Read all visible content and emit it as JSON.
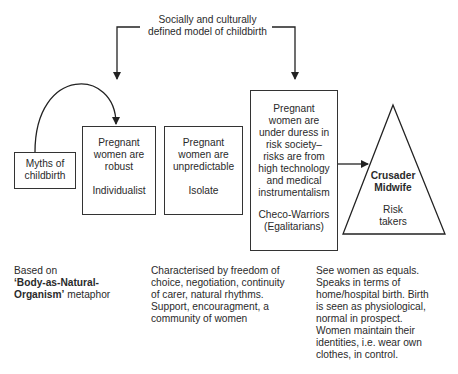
{
  "diagram": {
    "title_lines": [
      "Socially and culturally",
      "defined model of childbirth"
    ],
    "myths_box": {
      "lines": [
        "Myths of",
        "childbirth"
      ]
    },
    "box_robust": {
      "lines": [
        "Pregnant",
        "women are",
        "robust"
      ],
      "label": "Individualist"
    },
    "box_unpredictable": {
      "lines": [
        "Pregnant",
        "women are",
        "unpredictable"
      ],
      "label": "Isolate"
    },
    "box_duress": {
      "lines": [
        "Pregnant",
        "women are",
        "under duress in",
        "risk society–",
        "risks are from",
        "high technology",
        "and medical",
        "instrumentalism"
      ],
      "label_lines": [
        "Checo-Warriors",
        "(Egalitarians)"
      ]
    },
    "triangle": {
      "title_lines": [
        "Crusader",
        "Midwife"
      ],
      "sub_lines": [
        "Risk",
        "takers"
      ]
    },
    "notes": {
      "left": {
        "line1": "Based on",
        "bold1": "‘Body-as-Natural-",
        "bold2": "Organism’",
        "rest2": " metaphor"
      },
      "middle": [
        "Characterised by freedom of",
        "choice, negotiation, continuity",
        "of carer, natural rhythms.",
        "Support, encouragment, a",
        "community of women"
      ],
      "right": [
        "See women as equals.",
        "Speaks in terms of",
        "home/hospital birth. Birth",
        "is seen as physiological,",
        "normal in prospect.",
        "Women maintain their",
        "identities, i.e. wear own",
        "clothes, in control."
      ]
    }
  }
}
